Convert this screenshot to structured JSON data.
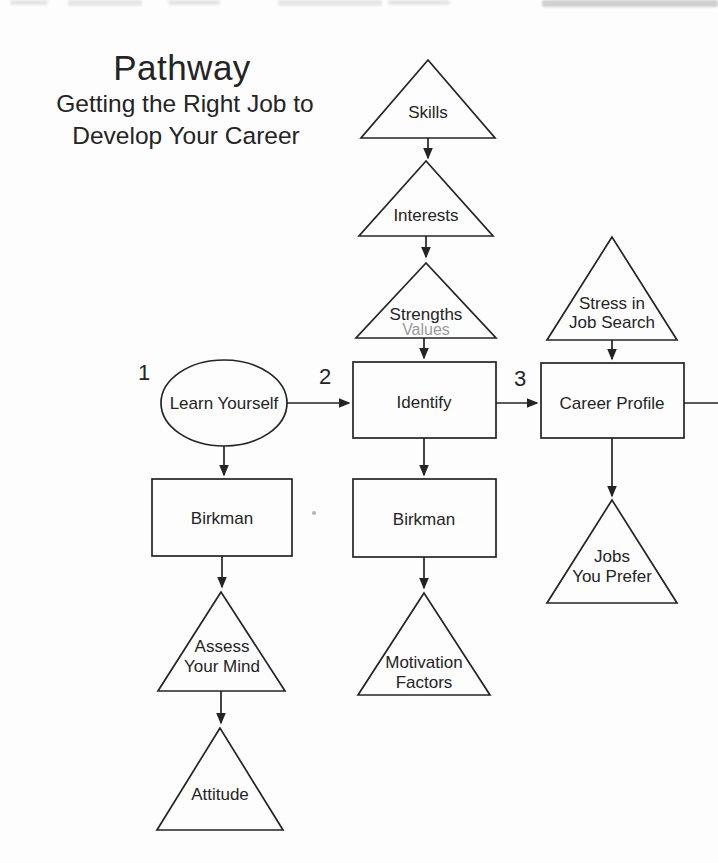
{
  "colors": {
    "ink": "#242424",
    "muted": "#9a9a9a",
    "paper": "#fdfdfd"
  },
  "title": {
    "main": "Pathway",
    "subtitle": [
      "Getting the Right Job to",
      "Develop Your Career"
    ]
  },
  "step_markers": {
    "one": "1",
    "two": "2",
    "three": "3"
  },
  "nodes": {
    "skills": {
      "shape": "triangle",
      "label": "Skills"
    },
    "interests": {
      "shape": "triangle",
      "label": "Interests"
    },
    "strengths": {
      "shape": "triangle",
      "label": "Strengths",
      "sublabel": "Values"
    },
    "identify": {
      "shape": "rectangle",
      "label": "Identify"
    },
    "learn_yourself": {
      "shape": "ellipse",
      "label": "Learn Yourself"
    },
    "birkman_left": {
      "shape": "rectangle",
      "label": "Birkman"
    },
    "assess_your_mind": {
      "shape": "triangle",
      "lines": [
        "Assess",
        "Your Mind"
      ]
    },
    "attitude": {
      "shape": "triangle",
      "label": "Attitude"
    },
    "birkman_middle": {
      "shape": "rectangle",
      "label": "Birkman"
    },
    "motivation_factors": {
      "shape": "triangle",
      "lines": [
        "Motivation",
        "Factors"
      ]
    },
    "stress_in_job_search": {
      "shape": "triangle",
      "lines": [
        "Stress in",
        "Job Search"
      ]
    },
    "career_profile": {
      "shape": "rectangle",
      "label": "Career Profile"
    },
    "jobs_you_prefer": {
      "shape": "triangle",
      "lines": [
        "Jobs",
        "You Prefer"
      ]
    }
  }
}
